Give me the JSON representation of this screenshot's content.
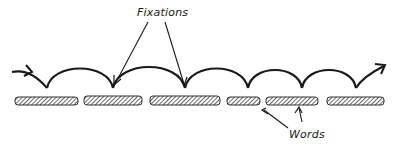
{
  "diagram": {
    "type": "eye-movement-saccade-diagram",
    "labels": {
      "fixations": "Fixations",
      "words": "Words"
    },
    "colors": {
      "stroke": "#1a1a1a",
      "hatch": "#555555",
      "background": "#ffffff"
    },
    "words": [
      {
        "id": 1,
        "text": "memory"
      },
      {
        "id": 2,
        "text": "material"
      },
      {
        "id": 3,
        "text": "registered"
      },
      {
        "id": 4,
        "text": "zone"
      },
      {
        "id": 5,
        "text": "approach"
      },
      {
        "id": 6,
        "text": "return"
      }
    ],
    "fixation_count_labeled": 2,
    "saccade_count": 6
  }
}
